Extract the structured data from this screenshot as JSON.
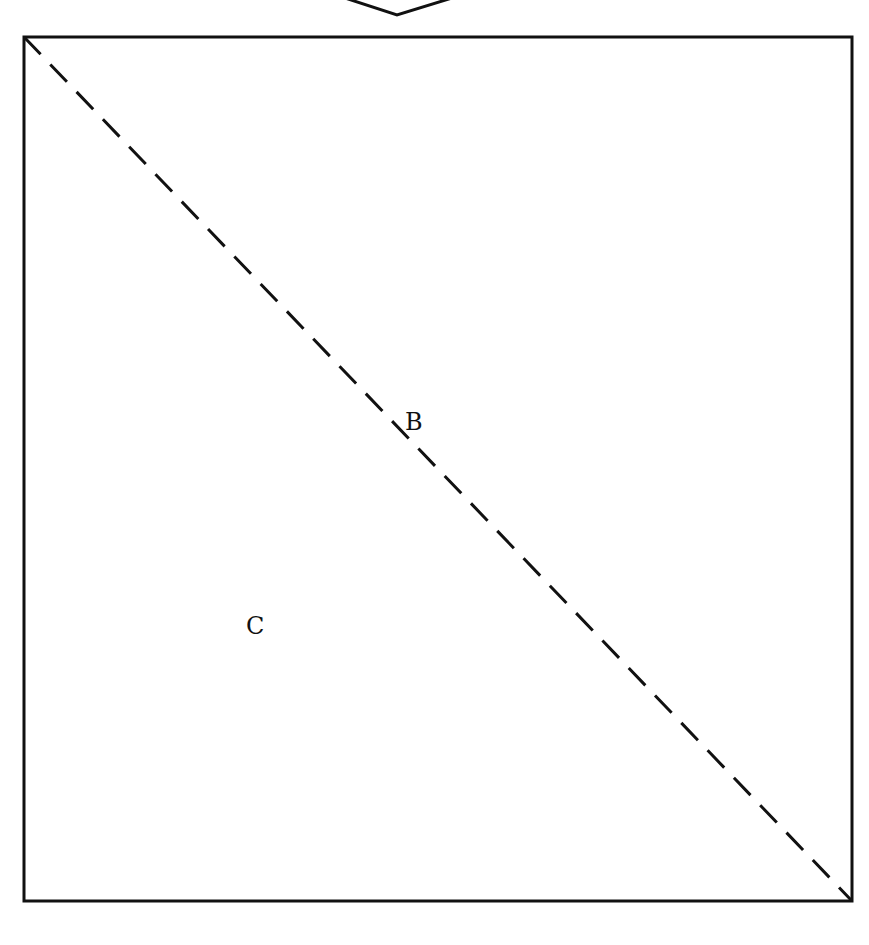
{
  "diagram": {
    "labels": {
      "b": "B",
      "c": "C"
    },
    "colors": {
      "stroke": "#111111",
      "background": "#ffffff"
    },
    "square": {
      "x": 23,
      "y": 36,
      "width": 830,
      "height": 866
    },
    "diagonal": {
      "style": "dashed",
      "from": "top-left",
      "to": "bottom-right"
    },
    "chevron": {
      "direction": "down",
      "position": "top-center"
    }
  }
}
